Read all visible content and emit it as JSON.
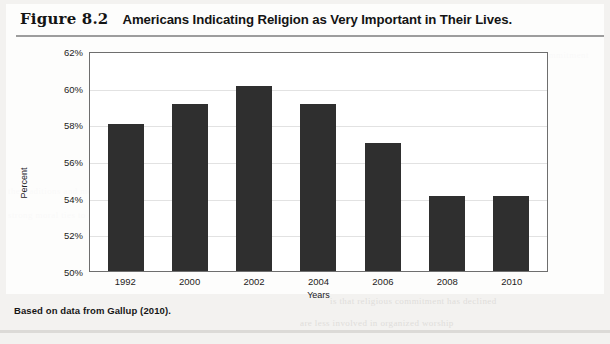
{
  "figure": {
    "number": "Figure 8.2",
    "title": "Americans Indicating Religion as Very Important in Their Lives.",
    "source_note": "Based on data from Gallup (2010)."
  },
  "bleed_text": {
    "line1": "ness about acceptability of behavior and commitment",
    "line2": "the traditions and meaning of religion",
    "line3": "strong moral ties to community",
    "line4": "is that religious commitment has declined",
    "line5": "are less involved in organized worship"
  },
  "colors": {
    "bar": "#2f2f2f",
    "plot_border": "#6e6e6e",
    "gridline": "#e2e2e2",
    "page_background": "#f3f2f0",
    "plot_background": "#ffffff"
  },
  "chart_data": {
    "type": "bar",
    "title": "Americans Indicating Religion as Very Important in Their Lives.",
    "xlabel": "Years",
    "ylabel": "Percent",
    "categories": [
      "1992",
      "2000",
      "2002",
      "2004",
      "2006",
      "2008",
      "2010"
    ],
    "values": [
      58.0,
      59.1,
      60.1,
      59.1,
      57.0,
      54.1,
      54.1
    ],
    "ylim": [
      50,
      62
    ],
    "ytick_labels": [
      "62%",
      "60%",
      "58%",
      "56%",
      "54%",
      "52%",
      "50%"
    ],
    "ytick_values": [
      62,
      60,
      58,
      56,
      54,
      52,
      50
    ],
    "grid": true,
    "legend": "none"
  }
}
